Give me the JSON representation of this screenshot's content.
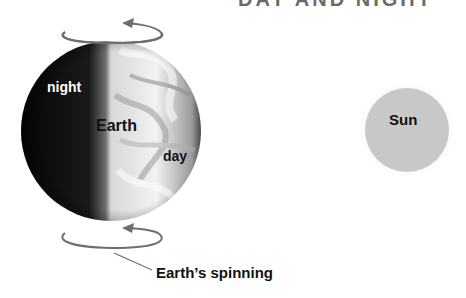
{
  "title": "DAY AND NIGHT",
  "labels": {
    "night": "night",
    "earth": "Earth",
    "day": "day",
    "sun": "Sun",
    "spinning": "Earth’s spinning"
  },
  "colors": {
    "night_side": "#0a0a0a",
    "day_side": "#e6e6e6",
    "sun_fill": "#c8c8c8",
    "arrow": "#6e6e6e",
    "background": "#ffffff"
  }
}
